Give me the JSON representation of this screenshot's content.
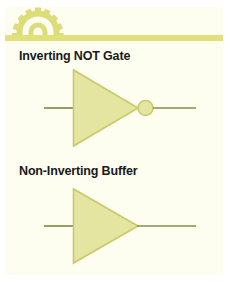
{
  "page": {
    "background_color": "#ffffff",
    "card_color": "#fdfdf0",
    "accent_color": "#e0e07c",
    "symbol_fill_color": "#e4e5a1",
    "symbol_stroke_color": "#c9c96a",
    "wire_color": "#8a8a50",
    "heading_color": "#1a1a1a"
  },
  "header": {
    "icon": "gear-icon",
    "rule": "horizontal-rule"
  },
  "sections": [
    {
      "title": "Inverting NOT Gate",
      "symbol": "not-gate-symbol",
      "has_inversion_bubble": true
    },
    {
      "title": "Non-Inverting Buffer",
      "symbol": "buffer-gate-symbol",
      "has_inversion_bubble": false
    }
  ]
}
